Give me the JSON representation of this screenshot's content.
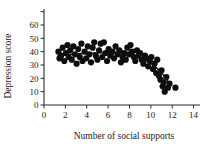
{
  "figure": {
    "background": "#ffffff",
    "ink_color": "#101010"
  },
  "chart_data": {
    "type": "scatter",
    "title": "",
    "subtitle": "",
    "xlabel": "Number of social supports",
    "ylabel": "Depression score",
    "xlim": [
      0,
      14.6
    ],
    "ylim": [
      0,
      72
    ],
    "grid": false,
    "legend": null,
    "x_ticks": [
      0,
      2,
      4,
      6,
      8,
      10,
      12,
      14
    ],
    "x_tick_labels": [
      "0",
      "2",
      "4",
      "6",
      "8",
      "10",
      "12",
      "14"
    ],
    "y_ticks": [
      0,
      10,
      20,
      30,
      40,
      50,
      60,
      70
    ],
    "y_tick_labels": [
      "0",
      "10",
      "20",
      "30",
      "40",
      "50",
      "60",
      ""
    ],
    "marker": {
      "shape": "circle",
      "color": "#0d0d0d",
      "size": 3.1
    },
    "points": [
      [
        1.35,
        40
      ],
      [
        1.45,
        35
      ],
      [
        1.6,
        37
      ],
      [
        1.75,
        43
      ],
      [
        1.9,
        33
      ],
      [
        2.05,
        39
      ],
      [
        2.2,
        45
      ],
      [
        2.3,
        36
      ],
      [
        2.45,
        41
      ],
      [
        2.6,
        34
      ],
      [
        2.75,
        44
      ],
      [
        2.9,
        38
      ],
      [
        3.05,
        31
      ],
      [
        3.2,
        42
      ],
      [
        3.35,
        36
      ],
      [
        3.5,
        46
      ],
      [
        3.6,
        33
      ],
      [
        3.8,
        40
      ],
      [
        3.95,
        35
      ],
      [
        4.1,
        44
      ],
      [
        4.25,
        38
      ],
      [
        4.4,
        32
      ],
      [
        4.55,
        43
      ],
      [
        4.7,
        47
      ],
      [
        4.85,
        37
      ],
      [
        5.0,
        34
      ],
      [
        5.15,
        41
      ],
      [
        5.3,
        46
      ],
      [
        5.45,
        36
      ],
      [
        5.6,
        47
      ],
      [
        5.75,
        39
      ],
      [
        5.9,
        33
      ],
      [
        6.05,
        42
      ],
      [
        6.2,
        37
      ],
      [
        6.4,
        40
      ],
      [
        6.55,
        35
      ],
      [
        6.7,
        44
      ],
      [
        6.9,
        38
      ],
      [
        7.05,
        41
      ],
      [
        7.2,
        32
      ],
      [
        7.35,
        36
      ],
      [
        7.5,
        39
      ],
      [
        7.65,
        34
      ],
      [
        7.8,
        43
      ],
      [
        7.95,
        38
      ],
      [
        8.1,
        45
      ],
      [
        8.25,
        40
      ],
      [
        8.4,
        36
      ],
      [
        8.55,
        33
      ],
      [
        8.7,
        41
      ],
      [
        8.85,
        37
      ],
      [
        9.0,
        39
      ],
      [
        9.15,
        34
      ],
      [
        9.3,
        31
      ],
      [
        9.45,
        37
      ],
      [
        9.6,
        35
      ],
      [
        9.75,
        29
      ],
      [
        9.9,
        33
      ],
      [
        10.05,
        36
      ],
      [
        10.2,
        27
      ],
      [
        10.35,
        31
      ],
      [
        10.5,
        24
      ],
      [
        10.6,
        34
      ],
      [
        10.75,
        22
      ],
      [
        10.9,
        19
      ],
      [
        11.0,
        26
      ],
      [
        11.1,
        14
      ],
      [
        11.2,
        17
      ],
      [
        11.3,
        10
      ],
      [
        11.45,
        21
      ],
      [
        11.6,
        13
      ],
      [
        11.75,
        16
      ],
      [
        12.3,
        13
      ]
    ],
    "fit_curve": {
      "label": "smoothed fit",
      "points": [
        [
          1.3,
          36.5
        ],
        [
          2.0,
          37.6
        ],
        [
          2.8,
          38.2
        ],
        [
          3.6,
          38.6
        ],
        [
          4.4,
          38.9
        ],
        [
          5.2,
          39.2
        ],
        [
          6.0,
          39.4
        ],
        [
          6.8,
          39.3
        ],
        [
          7.4,
          39.0
        ],
        [
          8.0,
          38.2
        ],
        [
          8.6,
          36.8
        ],
        [
          9.2,
          34.8
        ],
        [
          9.8,
          32.2
        ],
        [
          10.4,
          28.8
        ],
        [
          11.0,
          24.2
        ],
        [
          11.4,
          20.0
        ],
        [
          11.8,
          14.8
        ]
      ]
    }
  }
}
